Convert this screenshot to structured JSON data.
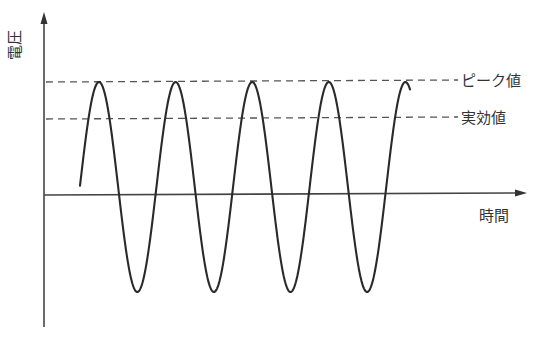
{
  "diagram": {
    "type": "sine-wave-voltage-diagram",
    "y_axis_label": "電圧",
    "x_axis_label": "時間",
    "reference_lines": [
      {
        "id": "peak",
        "label": "ピーク値",
        "y_px": 81,
        "style": "dashed"
      },
      {
        "id": "rms",
        "label": "実効値",
        "y_px": 118,
        "style": "dashed"
      }
    ],
    "colors": {
      "stroke": "#2a2a2a",
      "axis": "#444444",
      "dashed": "#555555",
      "text": "#333333",
      "background": "#ffffff"
    }
  },
  "chart_data": {
    "type": "line",
    "title": "",
    "xlabel": "時間",
    "ylabel": "電圧",
    "series": [
      {
        "name": "voltage",
        "shape": "sine",
        "cycles_visible": 4.3,
        "peaks": 5,
        "troughs": 4
      }
    ],
    "annotations": [
      {
        "text": "ピーク値",
        "meaning": "peak value",
        "y_relative": 1.0
      },
      {
        "text": "実効値",
        "meaning": "RMS value",
        "y_relative": 0.707
      }
    ],
    "grid": false,
    "legend": null
  }
}
